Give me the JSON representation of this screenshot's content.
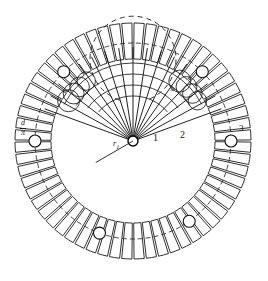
{
  "figure": {
    "background_color": "#ffffff",
    "line_color": "#151515",
    "center": {
      "x": 133,
      "y": 141
    },
    "labels": {
      "zone_1": "1",
      "zone_2": "2",
      "zone_3": "3",
      "pitch_d": "d",
      "radius_r1": "r",
      "radius_r1_sub": "1",
      "fraction_numerator": "d",
      "fraction_denominator": "π"
    },
    "geometry": {
      "hub_radius": 5,
      "inner_dashed_radius": 43,
      "ring_inner_radius": 82,
      "ring_mid_radius": 98,
      "ring_outer_radius": 118,
      "segment_count": 60,
      "ray_count": 17,
      "ray_fan_start_deg": -160,
      "ray_fan_end_deg": -20,
      "marker_circle_radius": 6,
      "marker_angles_deg": [
        -180,
        -135,
        -45,
        0,
        55,
        110
      ],
      "arc_gap_start_deg": -72,
      "arc_gap_end_deg": -108
    }
  },
  "chart_data": {
    "type": "diagram",
    "annotations": [
      {
        "text": "1",
        "meaning": "hub / central zone"
      },
      {
        "text": "2",
        "meaning": "intermediate zone"
      },
      {
        "text": "3",
        "meaning": "outer segmented ring"
      },
      {
        "text": "d",
        "meaning": "segment pitch"
      },
      {
        "text": "d/π",
        "meaning": "segment pitch over pi"
      },
      {
        "text": "r1",
        "meaning": "inner radius"
      }
    ]
  }
}
